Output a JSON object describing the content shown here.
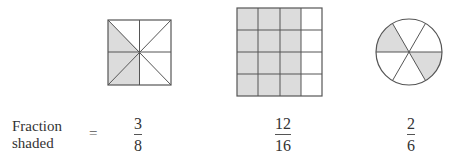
{
  "colors": {
    "shade": "#dcdcdc",
    "stroke": "#555555",
    "background": "#ffffff"
  },
  "figures": [
    {
      "type": "square-8-triangles",
      "parts": 8,
      "shaded": 3
    },
    {
      "type": "grid-4x4",
      "parts": 16,
      "shaded": 12
    },
    {
      "type": "circle-6-sectors",
      "parts": 6,
      "shaded": 2
    }
  ],
  "row_label": {
    "line1": "Fraction",
    "line2": "shaded"
  },
  "equals": "=",
  "fractions": [
    {
      "numerator": "3",
      "denominator": "8"
    },
    {
      "numerator": "12",
      "denominator": "16"
    },
    {
      "numerator": "2",
      "denominator": "6"
    }
  ]
}
